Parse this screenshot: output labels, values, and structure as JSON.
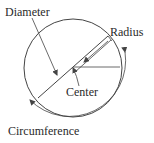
{
  "diagram": {
    "labels": {
      "diameter": "Diameter",
      "radius": "Radius",
      "center": "Center",
      "circumference": "Circumference"
    },
    "colors": {
      "stroke": "#444444",
      "text": "#2a2a2a",
      "background": "#ffffff"
    },
    "geometry": {
      "circle_center": [
        73,
        68
      ],
      "circle_radius": 50
    }
  }
}
